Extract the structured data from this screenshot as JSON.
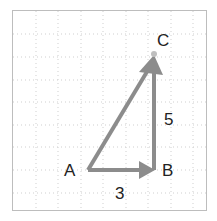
{
  "diagram": {
    "type": "vector-triangle",
    "grid": {
      "left": 13,
      "top": 11,
      "right": 206,
      "bottom": 210,
      "spacing": 22.5
    },
    "colors": {
      "arrow": "#8c8c8c",
      "text": "#222222",
      "grid": "#c8c8c8",
      "border": "#bdbdbd",
      "point": "#bfbfbf"
    },
    "points": {
      "A": {
        "label": "A",
        "x": 88,
        "y": 170
      },
      "B": {
        "label": "B",
        "x": 154,
        "y": 170
      },
      "C": {
        "label": "C",
        "x": 154,
        "y": 54
      }
    },
    "vectors": [
      {
        "from": "A",
        "to": "B",
        "length_label": "3"
      },
      {
        "from": "B",
        "to": "C",
        "length_label": "5"
      },
      {
        "from": "A",
        "to": "C",
        "length_label": ""
      }
    ],
    "labels": {
      "A": "A",
      "B": "B",
      "C": "C",
      "ab_length": "3",
      "bc_length": "5"
    }
  }
}
